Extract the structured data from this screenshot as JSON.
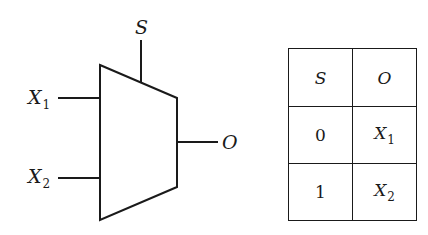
{
  "diagram": {
    "type": "multiplexer-2to1",
    "mux": {
      "select_label": "S",
      "inputs": [
        {
          "base": "X",
          "sub": "1"
        },
        {
          "base": "X",
          "sub": "2"
        }
      ],
      "output_label": "O"
    },
    "truth_table": {
      "headers": [
        "S",
        "O"
      ],
      "rows": [
        {
          "s": "0",
          "o_base": "X",
          "o_sub": "1"
        },
        {
          "s": "1",
          "o_base": "X",
          "o_sub": "2"
        }
      ]
    }
  }
}
